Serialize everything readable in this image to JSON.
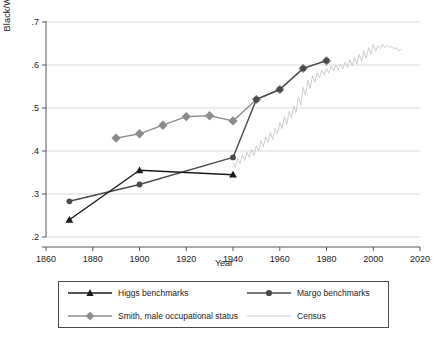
{
  "chart_data": {
    "type": "line",
    "title": "",
    "xlabel": "Year",
    "ylabel": "Black/White ratio",
    "xlim": [
      1860,
      2020
    ],
    "ylim": [
      0.2,
      0.7
    ],
    "xticks": [
      1860,
      1880,
      1900,
      1920,
      1940,
      1960,
      1980,
      2000,
      2020
    ],
    "xtick_labels": [
      "1860",
      "1880",
      "1900",
      "1920",
      "1940",
      "1960",
      "1980",
      "2000",
      "2020"
    ],
    "yticks": [
      0.2,
      0.3,
      0.4,
      0.5,
      0.6,
      0.7
    ],
    "ytick_labels": [
      ".2",
      ".3",
      ".4",
      ".5",
      ".6",
      ".7"
    ],
    "grid": "horizontal",
    "legend_position": "below-plot",
    "series": [
      {
        "name": "Higgs benchmarks",
        "marker": "triangle",
        "color": "#1a1a1a",
        "x": [
          1870,
          1900,
          1940
        ],
        "values": [
          0.24,
          0.355,
          0.345
        ]
      },
      {
        "name": "Margo benchmarks",
        "marker": "circle",
        "color": "#4a4a4a",
        "x": [
          1870,
          1900,
          1940,
          1950,
          1960,
          1970,
          1980
        ],
        "values": [
          0.283,
          0.322,
          0.385,
          0.52,
          0.543,
          0.592,
          0.61
        ]
      },
      {
        "name": "Smith, male occupational status",
        "marker": "diamond",
        "color": "#8c8c8c",
        "x": [
          1890,
          1900,
          1910,
          1920,
          1930,
          1940,
          1950,
          1960,
          1970,
          1980
        ],
        "values": [
          0.43,
          0.44,
          0.46,
          0.48,
          0.482,
          0.47,
          0.52,
          0.543,
          0.592,
          0.61
        ]
      },
      {
        "name": "Census",
        "marker": "none",
        "color": "#c8c8c8",
        "x": [
          1940,
          1941,
          1942,
          1943,
          1944,
          1945,
          1946,
          1947,
          1948,
          1949,
          1950,
          1951,
          1952,
          1953,
          1954,
          1955,
          1956,
          1957,
          1958,
          1959,
          1960,
          1961,
          1962,
          1963,
          1964,
          1965,
          1966,
          1967,
          1968,
          1969,
          1970,
          1971,
          1972,
          1973,
          1974,
          1975,
          1976,
          1977,
          1978,
          1979,
          1980,
          1981,
          1982,
          1983,
          1984,
          1985,
          1986,
          1987,
          1988,
          1989,
          1990,
          1991,
          1992,
          1993,
          1994,
          1995,
          1996,
          1997,
          1998,
          1999,
          2000,
          2001,
          2002,
          2003,
          2004,
          2005,
          2006,
          2007,
          2008,
          2009,
          2010,
          2011,
          2012
        ],
        "values": [
          0.372,
          0.362,
          0.383,
          0.371,
          0.39,
          0.378,
          0.397,
          0.385,
          0.404,
          0.39,
          0.412,
          0.4,
          0.424,
          0.41,
          0.433,
          0.42,
          0.443,
          0.427,
          0.452,
          0.44,
          0.466,
          0.452,
          0.48,
          0.462,
          0.492,
          0.478,
          0.505,
          0.49,
          0.526,
          0.507,
          0.548,
          0.53,
          0.565,
          0.545,
          0.575,
          0.56,
          0.582,
          0.57,
          0.588,
          0.577,
          0.592,
          0.581,
          0.597,
          0.586,
          0.6,
          0.588,
          0.603,
          0.591,
          0.607,
          0.593,
          0.612,
          0.598,
          0.618,
          0.602,
          0.625,
          0.608,
          0.633,
          0.615,
          0.64,
          0.625,
          0.648,
          0.632,
          0.645,
          0.638,
          0.648,
          0.64,
          0.646,
          0.641,
          0.643,
          0.638,
          0.64,
          0.633,
          0.636
        ]
      }
    ]
  },
  "legend": {
    "items": [
      {
        "label": "Higgs benchmarks",
        "marker": "triangle",
        "color": "#1a1a1a"
      },
      {
        "label": "Margo benchmarks",
        "marker": "circle",
        "color": "#4a4a4a"
      },
      {
        "label": "Smith, male occupational status",
        "marker": "diamond",
        "color": "#8c8c8c"
      },
      {
        "label": "Census",
        "marker": "none",
        "color": "#c8c8c8"
      }
    ]
  },
  "colors": {
    "higgs": "#1a1a1a",
    "margo": "#4a4a4a",
    "smith": "#8c8c8c",
    "census": "#c8c8c8",
    "axis": "#55585c",
    "grid": "#d9d9d9"
  }
}
